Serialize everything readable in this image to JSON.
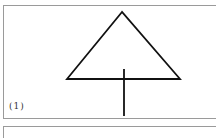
{
  "figure": {
    "panels": [
      {
        "label": "(1)",
        "shape": "triangle-with-vertical-stem",
        "stroke_color": "#111111",
        "triangle": {
          "apex": [
            122,
            12
          ],
          "base_left": [
            67,
            79
          ],
          "base_right": [
            180,
            79
          ]
        },
        "stem": {
          "x": 124,
          "y_top": 69,
          "y_bottom": 116
        }
      },
      {
        "label": ""
      }
    ]
  }
}
